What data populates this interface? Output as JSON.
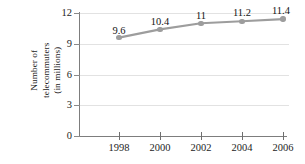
{
  "chart_data": {
    "type": "line",
    "title": "",
    "xlabel": "",
    "ylabel": "Number of telecommuters (in millions)",
    "ylabel_lines": [
      "Number of",
      "telecommuters",
      "(in millions)"
    ],
    "categories": [
      "1998",
      "2000",
      "2002",
      "2004",
      "2006"
    ],
    "x": [
      1998,
      2000,
      2002,
      2004,
      2006
    ],
    "values": [
      9.6,
      10.4,
      11,
      11.2,
      11.4
    ],
    "point_labels": [
      "9.6",
      "10.4",
      "11",
      "11.2",
      "11.4"
    ],
    "ylim": [
      0,
      12
    ],
    "yticks": [
      0,
      3,
      6,
      9,
      12
    ],
    "ytick_labels": [
      "0",
      "3",
      "6",
      "9",
      "12"
    ],
    "grid": true,
    "legend": "none",
    "series": [
      {
        "name": "Number of telecommuters",
        "values": [
          9.6,
          10.4,
          11,
          11.2,
          11.4
        ]
      }
    ],
    "colors": {
      "line": "#9d9d9d",
      "marker": "#9d9d9d",
      "grid": "#e2e2e2",
      "axis": "#7d7d7d",
      "text": "#1d1d1d",
      "background": "#ffffff"
    }
  }
}
